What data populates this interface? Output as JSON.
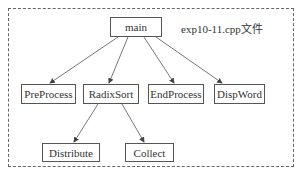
{
  "diagram": {
    "caption": "exp10-11.cpp文件",
    "nodes": {
      "main": "main",
      "preprocess": "PreProcess",
      "radixsort": "RadixSort",
      "endprocess": "EndProcess",
      "dispword": "DispWord",
      "distribute": "Distribute",
      "collect": "Collect"
    },
    "edges": [
      [
        "main",
        "PreProcess"
      ],
      [
        "main",
        "RadixSort"
      ],
      [
        "main",
        "EndProcess"
      ],
      [
        "main",
        "DispWord"
      ],
      [
        "RadixSort",
        "Distribute"
      ],
      [
        "RadixSort",
        "Collect"
      ]
    ],
    "colors": {
      "line": "#555555",
      "frame": "#666666",
      "background": "#ffffff"
    }
  }
}
